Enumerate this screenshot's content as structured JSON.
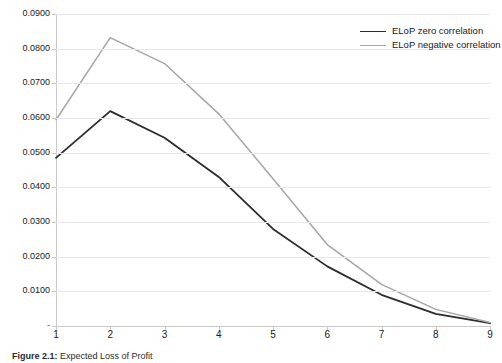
{
  "figure": {
    "caption_label": "Figure 2.1:",
    "caption_text": "Expected Loss of Profit"
  },
  "legend": {
    "position": "top-right",
    "entries": [
      {
        "label": "ELoP zero correlation",
        "color": "#2b2b2b"
      },
      {
        "label": "ELoP negative correlation",
        "color": "#a6a6a6"
      }
    ]
  },
  "chart_data": {
    "type": "line",
    "title": "",
    "subtitle": "",
    "xlabel": "",
    "ylabel": "",
    "x": [
      1,
      2,
      3,
      4,
      5,
      6,
      7,
      8,
      9
    ],
    "xtick_labels": [
      "1",
      "2",
      "3",
      "4",
      "5",
      "6",
      "7",
      "8",
      "9"
    ],
    "xlim": [
      1,
      9
    ],
    "ylim": [
      0,
      0.09
    ],
    "ytick_values": [
      0,
      0.01,
      0.02,
      0.03,
      0.04,
      0.05,
      0.06,
      0.07,
      0.08,
      0.09
    ],
    "ytick_labels": [
      "-",
      "0.0100",
      "0.0200",
      "0.0300",
      "0.0400",
      "0.0500",
      "0.0600",
      "0.0700",
      "0.0800",
      "0.0900"
    ],
    "grid": true,
    "grid_axis": "y",
    "legend_position": "upper right",
    "series": [
      {
        "name": "ELoP zero correlation",
        "color": "#2b2b2b",
        "width": 1.8,
        "values": [
          0.0485,
          0.062,
          0.0543,
          0.043,
          0.028,
          0.0172,
          0.009,
          0.0035,
          0.0008
        ]
      },
      {
        "name": "ELoP negative correlation",
        "color": "#a6a6a6",
        "width": 1.5,
        "values": [
          0.0595,
          0.0832,
          0.0757,
          0.0612,
          0.0425,
          0.0235,
          0.012,
          0.0048,
          0.001
        ]
      }
    ]
  }
}
